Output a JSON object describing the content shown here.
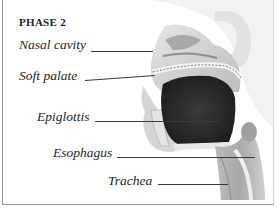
{
  "diagram": {
    "phase_title": "PHASE 2",
    "labels": [
      {
        "id": "nasal-cavity",
        "text": "Nasal cavity"
      },
      {
        "id": "soft-palate",
        "text": "Soft palate"
      },
      {
        "id": "epiglottis",
        "text": "Epiglottis"
      },
      {
        "id": "esophagus",
        "text": "Esophagus"
      },
      {
        "id": "trachea",
        "text": "Trachea"
      }
    ],
    "colors": {
      "skin_shade": "#c9c9c9",
      "mouth_bolus": "#2e2e2e",
      "frame_border": "#9a9a9a",
      "leader_line": "#3a3a3a"
    }
  }
}
